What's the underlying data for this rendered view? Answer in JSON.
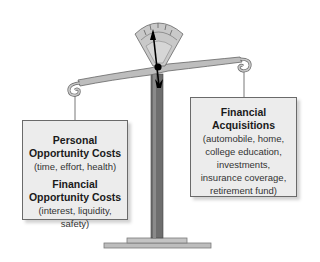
{
  "diagram": {
    "type": "balance-scale",
    "colors": {
      "metal": "#b8b8b8",
      "metal_dark": "#777777",
      "post": "#6e6e6e",
      "box_fill": "#ececec",
      "box_border": "#6a6a6a",
      "needle": "#000000"
    },
    "left_pan": {
      "sections": [
        {
          "title_line1": "Personal",
          "title_line2": "Opportunity Costs",
          "detail": "(time, effort, health)"
        },
        {
          "title_line1": "Financial",
          "title_line2": "Opportunity Costs",
          "detail": "(interest, liquidity, safety)"
        }
      ]
    },
    "right_pan": {
      "title_line1": "Financial",
      "title_line2": "Acquisitions",
      "details": [
        "(automobile, home,",
        "college education,",
        "investments,",
        "insurance coverage,",
        "retirement fund)"
      ]
    }
  }
}
